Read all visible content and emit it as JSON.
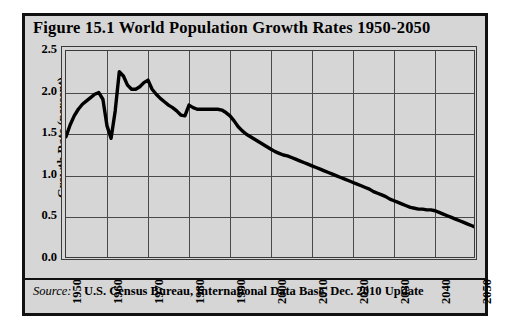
{
  "figure": {
    "title": "Figure 15.1  World Population Growth Rates 1950-2050",
    "source_label": "Source:",
    "source_text": "U.S. Census Bureau, International Data Base, Dec. 2010 Update",
    "background_color": "#d6d6d6",
    "border_color": "#111111",
    "line_color": "#000000"
  },
  "chart_data": {
    "type": "line",
    "title": "Figure 15.1  World Population Growth Rates 1950-2050",
    "xlabel": "",
    "ylabel": "Growth Rate (percent)",
    "xlim": [
      1950,
      2050
    ],
    "ylim": [
      0.0,
      2.5
    ],
    "grid": true,
    "legend": "none",
    "xticks": [
      "1950",
      "1960",
      "1970",
      "1980",
      "1990",
      "2000",
      "2010",
      "2020",
      "2030",
      "2040",
      "2050"
    ],
    "xtick_values": [
      1950,
      1960,
      1970,
      1980,
      1990,
      2000,
      2010,
      2020,
      2030,
      2040,
      2050
    ],
    "yticks": [
      "0.0",
      "0.5",
      "1.0",
      "1.5",
      "2.0",
      "2.5"
    ],
    "ytick_values": [
      0.0,
      0.5,
      1.0,
      1.5,
      2.0,
      2.5
    ],
    "series": [
      {
        "name": "World Population Growth Rate",
        "x": [
          1950,
          1951,
          1952,
          1953,
          1954,
          1955,
          1956,
          1957,
          1958,
          1959,
          1960,
          1961,
          1962,
          1963,
          1964,
          1965,
          1966,
          1967,
          1968,
          1969,
          1970,
          1971,
          1972,
          1973,
          1974,
          1975,
          1976,
          1977,
          1978,
          1979,
          1980,
          1981,
          1982,
          1983,
          1984,
          1985,
          1986,
          1987,
          1988,
          1989,
          1990,
          1991,
          1992,
          1993,
          1994,
          1995,
          1996,
          1997,
          1998,
          1999,
          2000,
          2001,
          2002,
          2003,
          2004,
          2005,
          2006,
          2007,
          2008,
          2009,
          2010,
          2011,
          2012,
          2013,
          2014,
          2015,
          2016,
          2017,
          2018,
          2019,
          2020,
          2021,
          2022,
          2023,
          2024,
          2025,
          2026,
          2027,
          2028,
          2029,
          2030,
          2031,
          2032,
          2033,
          2034,
          2035,
          2036,
          2037,
          2038,
          2039,
          2040,
          2041,
          2042,
          2043,
          2044,
          2045,
          2046,
          2047,
          2048,
          2049,
          2050
        ],
        "y": [
          1.47,
          1.61,
          1.72,
          1.8,
          1.86,
          1.9,
          1.94,
          1.98,
          2.0,
          1.92,
          1.6,
          1.45,
          1.78,
          2.25,
          2.2,
          2.09,
          2.04,
          2.04,
          2.07,
          2.12,
          2.15,
          2.04,
          1.98,
          1.93,
          1.89,
          1.85,
          1.82,
          1.78,
          1.73,
          1.72,
          1.85,
          1.82,
          1.8,
          1.8,
          1.8,
          1.8,
          1.8,
          1.8,
          1.79,
          1.76,
          1.72,
          1.66,
          1.59,
          1.54,
          1.5,
          1.47,
          1.44,
          1.41,
          1.38,
          1.35,
          1.32,
          1.29,
          1.27,
          1.25,
          1.24,
          1.22,
          1.2,
          1.18,
          1.16,
          1.14,
          1.12,
          1.1,
          1.08,
          1.06,
          1.04,
          1.02,
          1.0,
          0.98,
          0.96,
          0.94,
          0.92,
          0.9,
          0.88,
          0.86,
          0.84,
          0.81,
          0.79,
          0.77,
          0.75,
          0.72,
          0.7,
          0.68,
          0.66,
          0.64,
          0.62,
          0.61,
          0.6,
          0.6,
          0.59,
          0.59,
          0.58,
          0.56,
          0.54,
          0.52,
          0.5,
          0.48,
          0.46,
          0.44,
          0.42,
          0.4,
          0.38
        ]
      }
    ],
    "annotations": [
      {
        "label": "peak",
        "x": 1963,
        "y": 2.25
      },
      {
        "label": "trough",
        "x": 1961,
        "y": 1.45
      },
      {
        "label": "end",
        "x": 2050,
        "y": 0.38
      }
    ]
  }
}
